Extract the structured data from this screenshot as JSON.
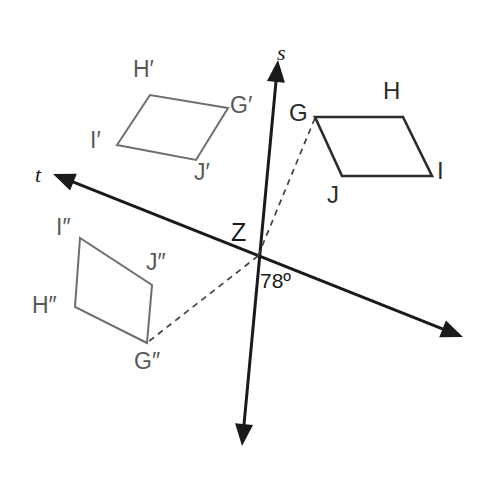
{
  "figure": {
    "type": "geometry-diagram",
    "width": 484,
    "height": 481,
    "background_color": "#ffffff"
  },
  "colors": {
    "axis_stroke": "#1a1a1a",
    "original_shape_stroke": "#2b2b2b",
    "image_shape_stroke": "#6d6e71",
    "dashed_stroke": "#404040",
    "label_primary": "#2b2b2b",
    "label_image": "#58595b"
  },
  "axes": [
    {
      "name": "s",
      "label": "s",
      "label_x": 277,
      "label_y": 42,
      "x1": 278,
      "y1": 60,
      "x2": 242,
      "y2": 446,
      "arrow_start": true,
      "arrow_end": true,
      "stroke_width": 3
    },
    {
      "name": "t",
      "label": "t",
      "label_x": 35,
      "label_y": 164,
      "x1": 53,
      "y1": 174,
      "x2": 463,
      "y2": 337,
      "arrow_start": true,
      "arrow_end": true,
      "stroke_width": 3
    }
  ],
  "center": {
    "label": "Z",
    "label_x": 231,
    "label_y": 220,
    "x": 258,
    "y": 256
  },
  "angle": {
    "label": "78º",
    "value": 78,
    "unit": "degrees",
    "label_x": 260,
    "label_y": 270
  },
  "shapes": [
    {
      "id": "original",
      "name": "GHIJ",
      "style": "solid-dark",
      "stroke_width": 2.6,
      "vertices": [
        {
          "name": "G",
          "label": "G",
          "x": 315,
          "y": 117,
          "label_x": 289,
          "label_y": 101
        },
        {
          "name": "H",
          "label": "H",
          "x": 403,
          "y": 117,
          "label_x": 383,
          "label_y": 79
        },
        {
          "name": "I",
          "label": "I",
          "x": 432,
          "y": 176,
          "label_x": 437,
          "label_y": 159
        },
        {
          "name": "J",
          "label": "J",
          "x": 342,
          "y": 176,
          "label_x": 327,
          "label_y": 183
        }
      ]
    },
    {
      "id": "image1",
      "name": "G'H'I'J'",
      "style": "solid-gray",
      "stroke_width": 2,
      "vertices": [
        {
          "name": "G-prime",
          "label": "G′",
          "x": 228,
          "y": 108,
          "label_x": 230,
          "label_y": 94
        },
        {
          "name": "H-prime",
          "label": "H′",
          "x": 150,
          "y": 95,
          "label_x": 133,
          "label_y": 58
        },
        {
          "name": "I-prime",
          "label": "I′",
          "x": 117,
          "y": 145,
          "label_x": 90,
          "label_y": 129
        },
        {
          "name": "J-prime",
          "label": "J′",
          "x": 196,
          "y": 160,
          "label_x": 194,
          "label_y": 161
        }
      ]
    },
    {
      "id": "image2",
      "name": "G''H''I''J''",
      "style": "solid-gray",
      "stroke_width": 2,
      "vertices": [
        {
          "name": "G-double-prime",
          "label": "G″",
          "x": 147,
          "y": 343,
          "label_x": 134,
          "label_y": 350
        },
        {
          "name": "H-double-prime",
          "label": "H″",
          "x": 75,
          "y": 307,
          "label_x": 32,
          "label_y": 294
        },
        {
          "name": "I-double-prime",
          "label": "I″",
          "x": 80,
          "y": 238,
          "label_x": 56,
          "label_y": 216
        },
        {
          "name": "J-double-prime",
          "label": "J″",
          "x": 152,
          "y": 285,
          "label_x": 146,
          "label_y": 251
        }
      ]
    }
  ],
  "dashed_segments": [
    {
      "name": "z-to-g",
      "x1": 258,
      "y1": 256,
      "x2": 315,
      "y2": 118
    },
    {
      "name": "z-to-g-double-prime",
      "x1": 258,
      "y1": 256,
      "x2": 148,
      "y2": 342
    }
  ]
}
